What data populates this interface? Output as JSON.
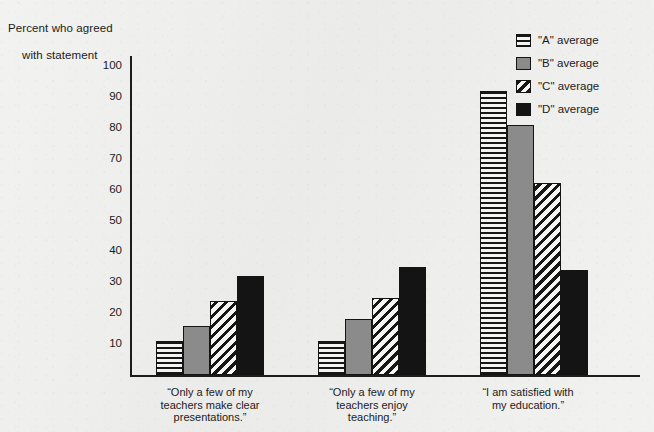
{
  "chart_data": {
    "type": "bar",
    "title": "Percent who agreed with statement",
    "title_line1": "Percent who agreed",
    "title_line2": "with statement",
    "xlabel": "",
    "ylabel": "Percent who agreed with statement",
    "ylim": [
      0,
      100
    ],
    "y_ticks": [
      100,
      90,
      80,
      70,
      60,
      50,
      40,
      30,
      20,
      10
    ],
    "grid": false,
    "legend_position": "top-right",
    "categories": [
      "\"Only a few of my\nteachers make clear\npresentations.\"",
      "\"Only a few of my\nteachers enjoy\nteaching.\"",
      "\"I am satisfied with\nmy education.\""
    ],
    "series": [
      {
        "name": "\"A\" average",
        "pattern": "horizontal-lines",
        "color": "#f4f4f2",
        "values": [
          11,
          11,
          92
        ]
      },
      {
        "name": "\"B\" average",
        "pattern": "solid-gray",
        "color": "#8b8b8b",
        "values": [
          16,
          18,
          81
        ]
      },
      {
        "name": "\"C\" average",
        "pattern": "diagonal-hatch",
        "color": "#f6f6f4",
        "values": [
          24,
          25,
          62
        ]
      },
      {
        "name": "\"D\" average",
        "pattern": "solid-black",
        "color": "#141414",
        "values": [
          32,
          35,
          34
        ]
      }
    ]
  },
  "legend": {
    "items": [
      {
        "label": "\"A\" average"
      },
      {
        "label": "\"B\" average"
      },
      {
        "label": "\"C\" average"
      },
      {
        "label": "\"D\" average"
      }
    ]
  },
  "axis": {
    "y_tick_labels": [
      "100",
      "90",
      "80",
      "70",
      "60",
      "50",
      "40",
      "30",
      "20",
      "10"
    ]
  },
  "categories_display": [
    {
      "line1": "“Only a few of my",
      "line2": "teachers make clear",
      "line3": "presentations.”"
    },
    {
      "line1": "“Only a few of my",
      "line2": "teachers enjoy",
      "line3": "teaching.”"
    },
    {
      "line1": "“I am satisfied with",
      "line2": "my education.”",
      "line3": ""
    }
  ]
}
